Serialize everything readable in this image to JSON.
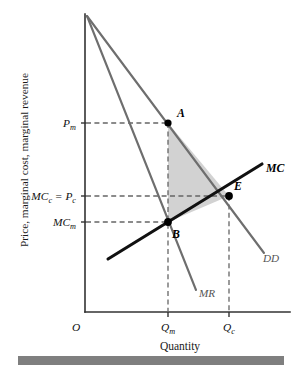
{
  "figure": {
    "axes": {
      "y_axis_label": "Price, marginal cost, marginal revenue",
      "x_axis_label": "Quantity",
      "origin_label": "O"
    },
    "y_ticks": [
      {
        "id": "pm",
        "label": "P",
        "sub": "m",
        "value_y": 123
      },
      {
        "id": "mcc_pc",
        "label": "MC",
        "sub": "c",
        "label2": " = P",
        "sub2": "c",
        "value_y": 196
      },
      {
        "id": "mcm",
        "label": "MC",
        "sub": "m",
        "value_y": 222
      }
    ],
    "x_ticks": [
      {
        "id": "qm",
        "label": "Q",
        "sub": "m",
        "value_x": 168
      },
      {
        "id": "qc",
        "label": "Q",
        "sub": "c",
        "value_x": 229
      }
    ],
    "curves": [
      {
        "id": "dd",
        "label": "DD",
        "style": "gray",
        "meaning": "demand-curve"
      },
      {
        "id": "mr",
        "label": "MR",
        "style": "gray",
        "meaning": "marginal-revenue-curve"
      },
      {
        "id": "mc",
        "label": "MC",
        "style": "bold-black",
        "meaning": "marginal-cost-curve"
      }
    ],
    "points": [
      {
        "id": "a",
        "label": "A",
        "meaning": "monopoly-price-point"
      },
      {
        "id": "b",
        "label": "B",
        "meaning": "monopoly-output-mc-point"
      },
      {
        "id": "e",
        "label": "E",
        "meaning": "competitive-equilibrium-point"
      }
    ],
    "shaded_region": {
      "name": "deadweight-loss-triangle",
      "color": "#d2d2d2",
      "vertices": [
        "A",
        "B",
        "E"
      ]
    },
    "colors": {
      "curve_gray": "#6e6e6e",
      "curve_black": "#111111",
      "shade": "#d2d2d2",
      "axis": "#333333",
      "footer_bar": "#7f7f7f"
    }
  }
}
